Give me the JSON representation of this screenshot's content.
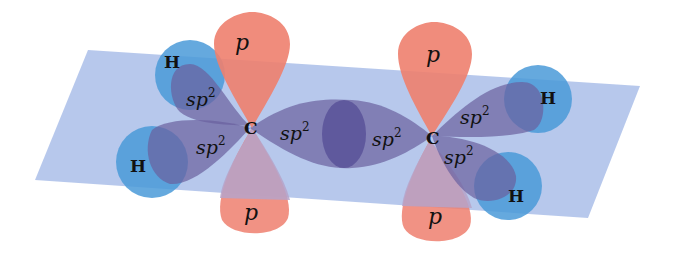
{
  "colors": {
    "plane": "#9fb6e6",
    "p_orbital": "#ee7f6e",
    "sp2_orbital": "#6a5f9e",
    "hydrogen": "#4a9ad8"
  },
  "labels": {
    "carbon_left": "C",
    "carbon_right": "C",
    "h_top_left": "H",
    "h_bottom_left": "H",
    "h_top_right": "H",
    "h_bottom_right": "H",
    "p_top_left": "p",
    "p_bottom_left": "p",
    "p_top_right": "p",
    "p_bottom_right": "p",
    "sp2_base": "sp",
    "sp2_exp": "2"
  }
}
